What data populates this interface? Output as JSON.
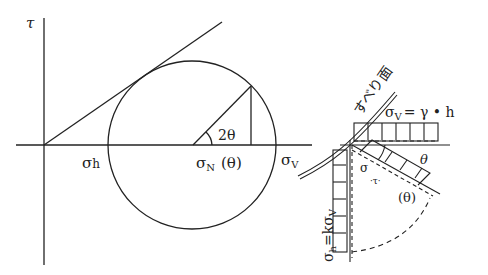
{
  "labels": {
    "tau_axis": "τ",
    "sigma_h": "σ",
    "sigma_h_sub": "h",
    "sigma_n": "σ",
    "sigma_n_sub": "N",
    "sigma_n_theta": "(θ)",
    "sigma_v": "σ",
    "sigma_v_sub": "V",
    "two_theta": "2θ",
    "slip_surface": "すべり面",
    "sigma_v_eq": "σ",
    "sigma_v_eq_sub": "V",
    "sigma_v_eq_rhs": "= γ • h",
    "sigma_h_eq": "σ",
    "sigma_h_eq_sub": "h",
    "sigma_h_eq_rhs": "=kσ",
    "sigma_h_eq_rhs_sub": "V",
    "theta_upper": "θ",
    "theta_lower": "(θ)",
    "sigma_small": "σ",
    "tau_small": "·τ·"
  },
  "colors": {
    "ink": "#222222",
    "background": "#ffffff"
  }
}
